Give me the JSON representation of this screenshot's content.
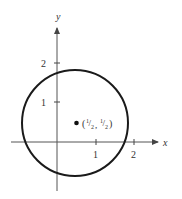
{
  "figure": {
    "type": "circle-on-axes",
    "axes": {
      "x_label": "x",
      "y_label": "y",
      "x_ticks": [
        {
          "value": 1,
          "label": "1"
        },
        {
          "value": 2,
          "label": "2"
        }
      ],
      "y_ticks": [
        {
          "value": 1,
          "label": "1"
        },
        {
          "value": 2,
          "label": "2"
        }
      ]
    },
    "circle": {
      "center": [
        0.5,
        0.5
      ],
      "radius": 1.3,
      "stroke_color": "#1a1a1a"
    },
    "center_point": {
      "label_open": "(",
      "label_x_num": "1",
      "label_x_den": "2",
      "label_sep": ",",
      "label_y_num": "1",
      "label_y_den": "2",
      "label_close": ")"
    },
    "axis_color": "#555555"
  }
}
